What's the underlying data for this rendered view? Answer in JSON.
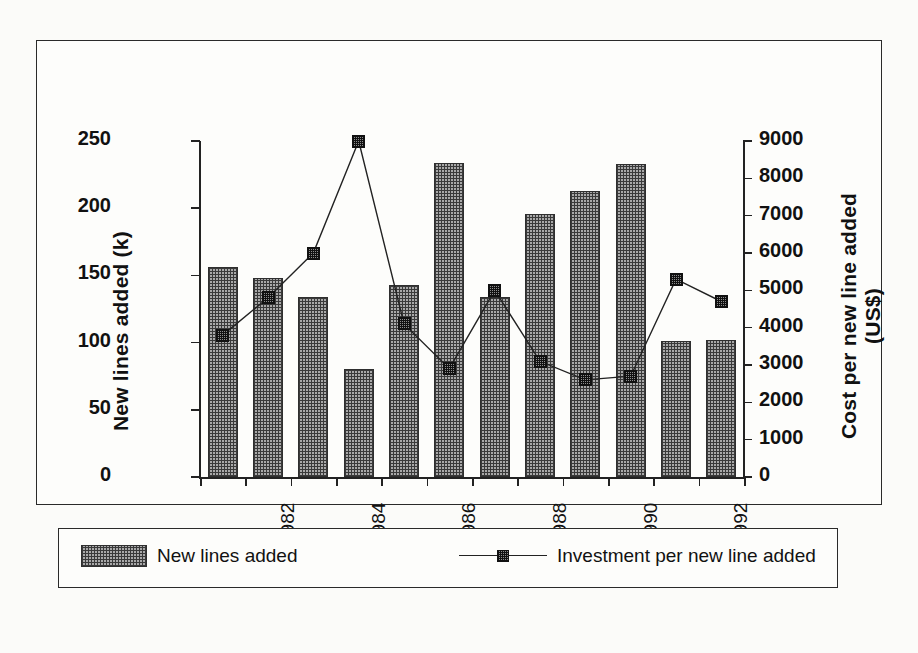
{
  "chart_data": {
    "type": "bar",
    "title": "",
    "categories": [
      "1981",
      "1982",
      "1983",
      "1984",
      "1985",
      "1986",
      "1987",
      "1988",
      "1989",
      "1990",
      "1991",
      "1992"
    ],
    "tick_labels_x": [
      "1982",
      "1984",
      "1986",
      "1988",
      "1990",
      "1992"
    ],
    "series": [
      {
        "name": "New lines added",
        "kind": "bar",
        "axis": "left",
        "values": [
          156,
          148,
          134,
          80,
          143,
          234,
          134,
          196,
          213,
          233,
          101,
          102
        ]
      },
      {
        "name": "Investment per new line added",
        "kind": "line",
        "axis": "right",
        "values": [
          3800,
          4800,
          6000,
          9000,
          4100,
          2900,
          5000,
          3100,
          2600,
          2700,
          5300,
          4700
        ]
      }
    ],
    "xlabel": "",
    "ylabel": "New lines added (k)",
    "y2label": "Cost per new line added (US$)",
    "ylim": [
      0,
      250
    ],
    "y2lim": [
      0,
      9000
    ],
    "yticks": [
      "0",
      "50",
      "100",
      "150",
      "200",
      "250"
    ],
    "y2ticks": [
      "0",
      "1000",
      "2000",
      "3000",
      "4000",
      "5000",
      "6000",
      "7000",
      "8000",
      "9000"
    ],
    "grid": false,
    "legend_position": "bottom"
  },
  "legend": {
    "bars_label": "New lines added",
    "line_label": "Investment per new line added"
  },
  "colors": {
    "bar_fill": "#a9a9a9",
    "bar_hatch": "#3a3a3a",
    "line": "#222222",
    "frame": "#2a2a2a",
    "background": "#fdfdfb"
  }
}
